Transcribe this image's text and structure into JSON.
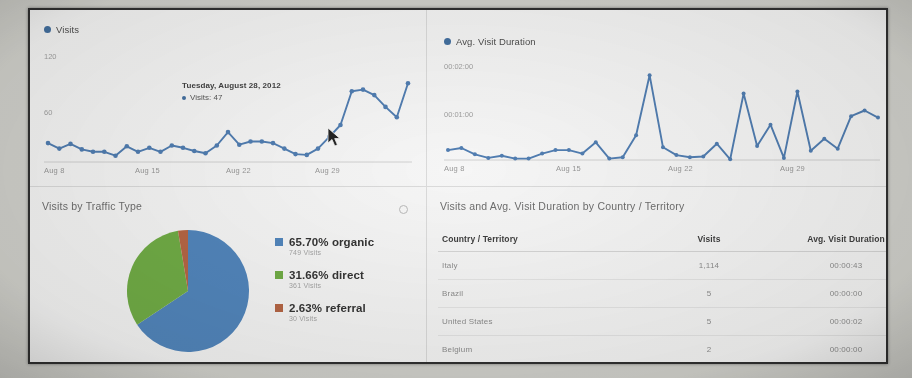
{
  "charts": {
    "visits": {
      "legend_label": "Visits",
      "yticks": [
        "120",
        "60"
      ],
      "xticks": [
        "Aug 8",
        "Aug 15",
        "Aug 22",
        "Aug 29"
      ],
      "tooltip": {
        "date": "Tuesday, August 28, 2012",
        "metric_label": "Visits:",
        "metric_value": "47"
      }
    },
    "duration": {
      "legend_label": "Avg. Visit Duration",
      "yticks": [
        "00:02:00",
        "00:01:00"
      ],
      "xticks": [
        "Aug 8",
        "Aug 15",
        "Aug 22",
        "Aug 29"
      ]
    }
  },
  "chart_data": [
    {
      "type": "line",
      "name": "visits-over-time",
      "title": "Visits",
      "xlabel": "",
      "ylabel": "Visits",
      "ylim": [
        0,
        150
      ],
      "ytick_values": [
        60,
        120
      ],
      "ytick_labels": [
        "60",
        "120"
      ],
      "grid": false,
      "legend": [
        "Visits"
      ],
      "legend_position": "top-left",
      "x": [
        "Aug 6",
        "Aug 7",
        "Aug 8",
        "Aug 9",
        "Aug 10",
        "Aug 11",
        "Aug 12",
        "Aug 13",
        "Aug 14",
        "Aug 15",
        "Aug 16",
        "Aug 17",
        "Aug 18",
        "Aug 19",
        "Aug 20",
        "Aug 21",
        "Aug 22",
        "Aug 23",
        "Aug 24",
        "Aug 25",
        "Aug 26",
        "Aug 27",
        "Aug 28",
        "Aug 29",
        "Aug 30",
        "Aug 31",
        "Sep 1",
        "Sep 2",
        "Sep 3",
        "Sep 4",
        "Sep 5",
        "Sep 6",
        "Sep 7"
      ],
      "values": [
        24,
        17,
        23,
        16,
        13,
        13,
        8,
        20,
        13,
        18,
        13,
        21,
        18,
        14,
        11,
        21,
        38,
        22,
        26,
        26,
        24,
        17,
        10,
        9,
        17,
        32,
        47,
        90,
        92,
        85,
        70,
        57,
        100
      ],
      "annotation": {
        "x": "Sep 1",
        "label_date": "Tuesday, August 28, 2012",
        "label_value": "Visits: 47"
      }
    },
    {
      "type": "line",
      "name": "avg-visit-duration-over-time",
      "title": "Avg. Visit Duration",
      "xlabel": "",
      "ylabel": "Avg. Visit Duration",
      "ylim": [
        0,
        150
      ],
      "ytick_values": [
        60,
        120
      ],
      "ytick_labels": [
        "00:01:00",
        "00:02:00"
      ],
      "grid": false,
      "legend": [
        "Avg. Visit Duration"
      ],
      "legend_position": "top-left",
      "x": [
        "Aug 6",
        "Aug 7",
        "Aug 8",
        "Aug 9",
        "Aug 10",
        "Aug 11",
        "Aug 12",
        "Aug 13",
        "Aug 14",
        "Aug 15",
        "Aug 16",
        "Aug 17",
        "Aug 18",
        "Aug 19",
        "Aug 20",
        "Aug 21",
        "Aug 22",
        "Aug 23",
        "Aug 24",
        "Aug 25",
        "Aug 26",
        "Aug 27",
        "Aug 28",
        "Aug 29",
        "Aug 30",
        "Aug 31",
        "Sep 1",
        "Sep 2",
        "Sep 3",
        "Sep 4",
        "Sep 5",
        "Sep 6",
        "Sep 7"
      ],
      "values": [
        14,
        17,
        8,
        3,
        6,
        2,
        2,
        9,
        14,
        14,
        9,
        25,
        2,
        4,
        35,
        120,
        18,
        7,
        4,
        5,
        23,
        1,
        94,
        20,
        50,
        3,
        97,
        13,
        30,
        16,
        62,
        70,
        60
      ]
    },
    {
      "type": "pie",
      "name": "visits-by-traffic-type",
      "title": "Visits by Traffic Type",
      "labels": [
        "organic",
        "direct",
        "referral"
      ],
      "percent": [
        65.7,
        31.66,
        2.63
      ],
      "visits": [
        749,
        361,
        30
      ],
      "colors": [
        "#4a87c7",
        "#6cb23a",
        "#c0633c"
      ],
      "legend_position": "right"
    },
    {
      "type": "table",
      "name": "visits-and-duration-by-country",
      "title": "Visits and Avg. Visit Duration by Country / Territory",
      "columns": [
        "Country / Territory",
        "Visits",
        "Avg. Visit Duration"
      ],
      "rows": [
        [
          "Italy",
          "1,114",
          "00:00:43"
        ],
        [
          "Brazil",
          "5",
          "00:00:00"
        ],
        [
          "United States",
          "5",
          "00:00:02"
        ],
        [
          "Belgium",
          "2",
          "00:00:00"
        ]
      ]
    }
  ],
  "traffic_panel": {
    "title": "Visits by Traffic Type",
    "legend": [
      {
        "percent": "65.70% organic",
        "visits": "749 Visits",
        "color": "#4a87c7"
      },
      {
        "percent": "31.66% direct",
        "visits": "361 Visits",
        "color": "#6cb23a"
      },
      {
        "percent": "2.63% referral",
        "visits": "30 Visits",
        "color": "#c0633c"
      }
    ]
  },
  "country_panel": {
    "title": "Visits and Avg. Visit Duration by Country / Territory",
    "columns": {
      "country": "Country / Territory",
      "visits": "Visits",
      "duration": "Avg. Visit Duration"
    },
    "rows": [
      {
        "country": "Italy",
        "visits": "1,114",
        "duration": "00:00:43"
      },
      {
        "country": "Brazil",
        "visits": "5",
        "duration": "00:00:00"
      },
      {
        "country": "United States",
        "visits": "5",
        "duration": "00:00:02"
      },
      {
        "country": "Belgium",
        "visits": "2",
        "duration": "00:00:00"
      }
    ]
  },
  "colors": {
    "series_blue": "#4a7ebb",
    "pie_blue": "#4a87c7",
    "pie_green": "#6cb23a",
    "pie_orange": "#c0633c"
  }
}
